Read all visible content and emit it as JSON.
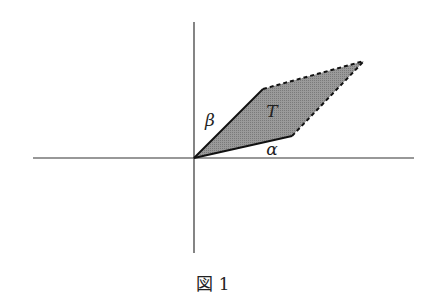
{
  "figure": {
    "caption": "図 1",
    "labels": {
      "alpha": "α",
      "beta": "β",
      "region": "T"
    },
    "colors": {
      "axis": "#333333",
      "edge": "#111111",
      "fill": "#8c8c8c",
      "background": "#ffffff"
    },
    "axes": {
      "origin": [
        194,
        158
      ],
      "x_axis": {
        "from": 33,
        "to": 414
      },
      "y_axis": {
        "from": 22,
        "to": 253
      }
    },
    "parallelogram": {
      "vertices": {
        "origin": [
          194,
          158
        ],
        "beta_tip": [
          263,
          89
        ],
        "far_corner": [
          364,
          61
        ],
        "alpha_tip": [
          292,
          136
        ]
      },
      "solid_edges": [
        "origin-beta_tip",
        "origin-alpha_tip"
      ],
      "dashed_edges": [
        "beta_tip-far_corner",
        "alpha_tip-far_corner"
      ]
    }
  }
}
